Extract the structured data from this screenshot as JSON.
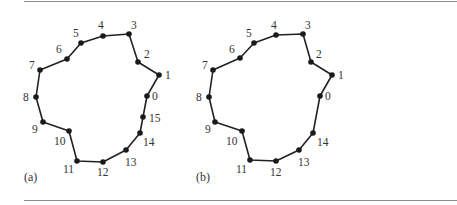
{
  "figure": {
    "panels": [
      {
        "label": "(a)",
        "label_pos": [
          24,
          181
        ],
        "points": [
          {
            "id": "0",
            "x": 147,
            "y": 96,
            "lx": 152,
            "ly": 100
          },
          {
            "id": "1",
            "x": 159,
            "y": 75,
            "lx": 165,
            "ly": 79
          },
          {
            "id": "2",
            "x": 138,
            "y": 62,
            "lx": 144,
            "ly": 58
          },
          {
            "id": "3",
            "x": 129,
            "y": 34,
            "lx": 131,
            "ly": 29
          },
          {
            "id": "4",
            "x": 103,
            "y": 36,
            "lx": 98,
            "ly": 29
          },
          {
            "id": "5",
            "x": 81,
            "y": 43,
            "lx": 73,
            "ly": 37
          },
          {
            "id": "6",
            "x": 67,
            "y": 59,
            "lx": 56,
            "ly": 53
          },
          {
            "id": "7",
            "x": 40,
            "y": 70,
            "lx": 29,
            "ly": 69
          },
          {
            "id": "8",
            "x": 36,
            "y": 97,
            "lx": 23,
            "ly": 101
          },
          {
            "id": "9",
            "x": 43,
            "y": 122,
            "lx": 32,
            "ly": 133
          },
          {
            "id": "10",
            "x": 69,
            "y": 131,
            "lx": 54,
            "ly": 145
          },
          {
            "id": "11",
            "x": 77,
            "y": 161,
            "lx": 63,
            "ly": 173
          },
          {
            "id": "12",
            "x": 103,
            "y": 162,
            "lx": 97,
            "ly": 176
          },
          {
            "id": "13",
            "x": 126,
            "y": 150,
            "lx": 125,
            "ly": 166
          },
          {
            "id": "14",
            "x": 140,
            "y": 133,
            "lx": 143,
            "ly": 146
          },
          {
            "id": "15",
            "x": 143,
            "y": 117,
            "lx": 149,
            "ly": 122
          }
        ]
      },
      {
        "label": "(b)",
        "label_pos": [
          196,
          181
        ],
        "points": [
          {
            "id": "0",
            "x": 320,
            "y": 96,
            "lx": 325,
            "ly": 100
          },
          {
            "id": "1",
            "x": 332,
            "y": 75,
            "lx": 338,
            "ly": 79
          },
          {
            "id": "2",
            "x": 311,
            "y": 62,
            "lx": 316,
            "ly": 58
          },
          {
            "id": "3",
            "x": 303,
            "y": 34,
            "lx": 305,
            "ly": 29
          },
          {
            "id": "4",
            "x": 276,
            "y": 35,
            "lx": 271,
            "ly": 29
          },
          {
            "id": "5",
            "x": 254,
            "y": 43,
            "lx": 246,
            "ly": 37
          },
          {
            "id": "6",
            "x": 240,
            "y": 58,
            "lx": 229,
            "ly": 53
          },
          {
            "id": "7",
            "x": 213,
            "y": 70,
            "lx": 202,
            "ly": 69
          },
          {
            "id": "8",
            "x": 209,
            "y": 97,
            "lx": 196,
            "ly": 101
          },
          {
            "id": "9",
            "x": 215,
            "y": 122,
            "lx": 205,
            "ly": 133
          },
          {
            "id": "10",
            "x": 242,
            "y": 131,
            "lx": 226,
            "ly": 145
          },
          {
            "id": "11",
            "x": 250,
            "y": 160,
            "lx": 236,
            "ly": 173
          },
          {
            "id": "12",
            "x": 276,
            "y": 161,
            "lx": 270,
            "ly": 176
          },
          {
            "id": "13",
            "x": 299,
            "y": 150,
            "lx": 298,
            "ly": 166
          },
          {
            "id": "14",
            "x": 313,
            "y": 133,
            "lx": 317,
            "ly": 146
          }
        ]
      }
    ],
    "colors": {
      "line": "#222222",
      "point": "#1a1a1a",
      "label": "#333333",
      "rule": "#8a8a8a"
    }
  }
}
